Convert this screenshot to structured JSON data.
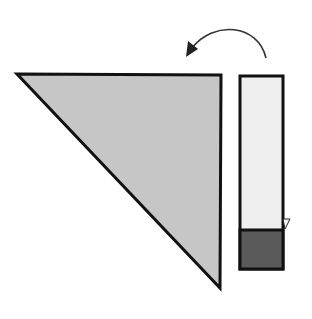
{
  "diagram": {
    "colors": {
      "background": "#ffffff",
      "triangle_fill": "#c6c6c6",
      "strip_light_fill": "#efefef",
      "strip_dark_fill": "#5a5a5a",
      "stroke": "#111111",
      "arrow": "#333333"
    },
    "shapes": {
      "triangle": {
        "points": "17,74 221,75 220,288"
      },
      "strip": {
        "x": 240,
        "y": 76,
        "width": 43,
        "height": 193
      },
      "strip_dark_band": {
        "x": 240,
        "y": 230,
        "width": 43,
        "height": 39
      },
      "fold_flap": {
        "points": "283,218 290,218 285,228"
      },
      "rotate_arrow": {
        "path": "M 266 58 C 256 22, 208 22, 186 56"
      }
    }
  }
}
